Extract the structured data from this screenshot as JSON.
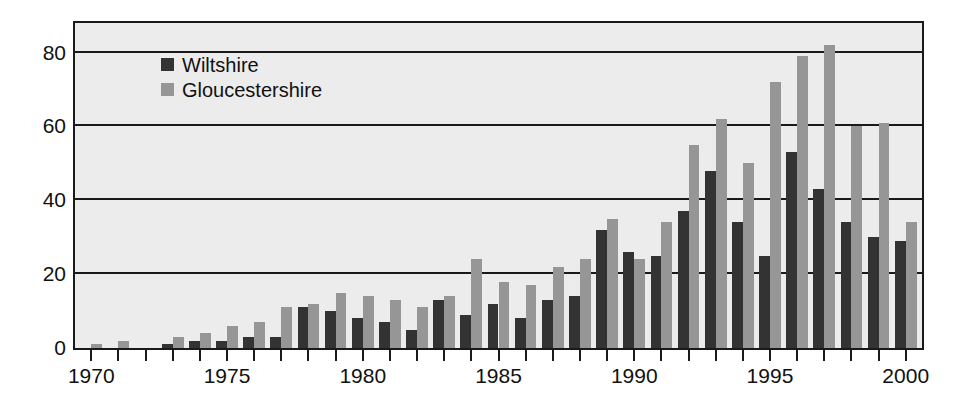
{
  "chart_data": {
    "type": "bar",
    "title": "",
    "xlabel": "",
    "ylabel": "",
    "ylim": [
      0,
      88
    ],
    "xlim": [
      1969.4,
      2000.6
    ],
    "grid": true,
    "legend_position": "top-left",
    "yticks": [
      0,
      20,
      40,
      60,
      80
    ],
    "ytick_labels": [
      "0",
      "20",
      "40",
      "60",
      "80"
    ],
    "xticks": [
      1970,
      1975,
      1980,
      1985,
      1990,
      1995,
      2000
    ],
    "xtick_labels": [
      "1970",
      "1975",
      "1980",
      "1985",
      "1990",
      "1995",
      "2000"
    ],
    "minor_xticks_every": 1,
    "categories": [
      "1970",
      "1971",
      "1972",
      "1973",
      "1974",
      "1975",
      "1976",
      "1977",
      "1978",
      "1979",
      "1980",
      "1981",
      "1982",
      "1983",
      "1984",
      "1985",
      "1986",
      "1987",
      "1988",
      "1989",
      "1990",
      "1991",
      "1992",
      "1993",
      "1994",
      "1995",
      "1996",
      "1997",
      "1998",
      "1999",
      "2000"
    ],
    "series": [
      {
        "name": "Wiltshire",
        "color": "#333333",
        "values": [
          0,
          0,
          0,
          1,
          2,
          2,
          3,
          3,
          11,
          10,
          8,
          7,
          5,
          13,
          9,
          12,
          8,
          13,
          14,
          32,
          26,
          25,
          37,
          48,
          34,
          25,
          53,
          43,
          34,
          30,
          29
        ]
      },
      {
        "name": "Gloucestershire",
        "color": "#969696",
        "values": [
          1,
          2,
          0,
          3,
          4,
          6,
          7,
          11,
          12,
          15,
          14,
          13,
          11,
          14,
          24,
          18,
          17,
          22,
          24,
          35,
          24,
          34,
          55,
          62,
          50,
          72,
          79,
          82,
          60,
          61,
          34
        ]
      }
    ]
  },
  "legend": {
    "items": [
      {
        "label": "Wiltshire",
        "color": "#333333"
      },
      {
        "label": "Gloucestershire",
        "color": "#969696"
      }
    ]
  },
  "colors": {
    "plot_background": "#ececec",
    "axis": "#1a1a1a",
    "page_background": "#ffffff",
    "wiltshire": "#333333",
    "gloucestershire": "#969696"
  }
}
